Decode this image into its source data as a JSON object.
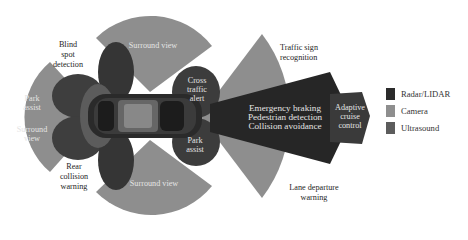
{
  "diagram": {
    "title": "",
    "labels": {
      "blind_spot": [
        "Blind",
        "spot",
        "detection"
      ],
      "rear_collision": [
        "Rear",
        "collision",
        "warning"
      ],
      "park_assist_rear": [
        "Park",
        "assist"
      ],
      "surround_view_rear": [
        "Surround",
        "view"
      ],
      "surround_view_top": "Surround view",
      "surround_view_bottom": "Surround view",
      "cross_traffic": [
        "Cross",
        "traffic",
        "alert"
      ],
      "park_assist_front": [
        "Park",
        "assist"
      ],
      "traffic_sign": [
        "Traffic sign",
        "recognition"
      ],
      "lane_departure": [
        "Lane departure",
        "warning"
      ],
      "front_radar": [
        "Emergency braking",
        "Pedestrian detection",
        "Collision avoidance"
      ],
      "adaptive_cruise": [
        "Adaptive",
        "cruise",
        "control"
      ]
    },
    "legend": [
      {
        "label": "Radar/LIDAR",
        "color": "#2b2b2b"
      },
      {
        "label": "Camera",
        "color": "#8e8e8e"
      },
      {
        "label": "Ultrasound",
        "color": "#5c5c5c"
      }
    ],
    "colors": {
      "radar": "#2b2b2b",
      "camera": "#8e8e8e",
      "ultrasound": "#5c5c5c",
      "car_body": "#3a3a3a"
    }
  }
}
